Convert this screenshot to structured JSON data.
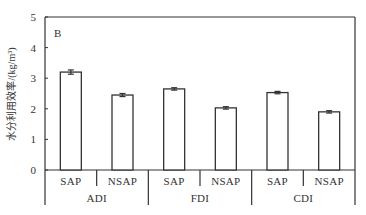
{
  "chart_data": {
    "type": "bar",
    "panel_label": "B",
    "title": "",
    "xlabel": "",
    "ylabel": "水分利用效率/(kg/m³)",
    "ylim": [
      0,
      5
    ],
    "yticks": [
      0,
      1,
      2,
      3,
      4,
      5
    ],
    "grid": false,
    "legend": null,
    "groups": [
      "ADI",
      "FDI",
      "CDI"
    ],
    "subcategories": [
      "SAP",
      "NSAP"
    ],
    "categories": [
      "ADI-SAP",
      "ADI-NSAP",
      "FDI-SAP",
      "FDI-NSAP",
      "CDI-SAP",
      "CDI-NSAP"
    ],
    "values": [
      3.2,
      2.45,
      2.65,
      2.03,
      2.53,
      1.9
    ],
    "errors": [
      0.07,
      0.05,
      0.03,
      0.04,
      0.02,
      0.03
    ],
    "bar_fill": "#ffffff",
    "bar_stroke": "#333333"
  }
}
